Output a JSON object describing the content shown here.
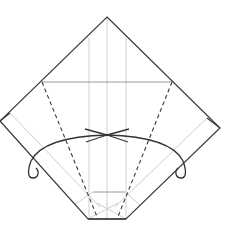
{
  "diagram": {
    "type": "origami-fold-diagram",
    "width": 236,
    "height": 232,
    "colors": {
      "outline": "#3a3a3a",
      "crease_light": "#c8c8c8",
      "crease_mid": "#9a9a9a",
      "dashed": "#3a3a3a",
      "arrow": "#333333",
      "background": "#ffffff"
    },
    "outline_points": "107,17 220,128 126,219 88,219 0,121",
    "elements": {
      "horizontal_crease": {
        "x1": 42,
        "y1": 82,
        "x2": 172,
        "y2": 82
      },
      "center_crease": {
        "x1": 107,
        "y1": 17,
        "x2": 107,
        "y2": 219
      },
      "left_vertical_crease": {
        "x1": 89,
        "y1": 38,
        "x2": 89,
        "y2": 219
      },
      "right_vertical_crease": {
        "x1": 126,
        "y1": 38,
        "x2": 126,
        "y2": 219
      },
      "left_dashed_fold": {
        "x1": 42,
        "y1": 82,
        "x2": 98,
        "y2": 219
      },
      "right_dashed_fold": {
        "x1": 172,
        "y1": 82,
        "x2": 117,
        "y2": 219
      },
      "left_diagonal_crease": {
        "x1": 10,
        "y1": 113,
        "x2": 100,
        "y2": 205
      },
      "right_diagonal_crease": {
        "x1": 205,
        "y1": 117,
        "x2": 115,
        "y2": 205
      },
      "bottom_horizontal_crease": {
        "x1": 93,
        "y1": 192,
        "x2": 125,
        "y2": 192
      }
    },
    "arrow_meeting_point": {
      "x": 107,
      "y": 135
    }
  }
}
